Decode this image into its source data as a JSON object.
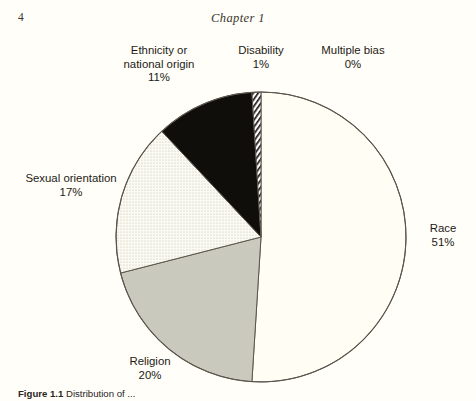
{
  "page": {
    "number": "4",
    "running_head": "Chapter 1"
  },
  "figure": {
    "caption_label": "Figure 1.1",
    "caption_text": "Distribution of ...",
    "center_x": 261,
    "center_y": 237,
    "radius": 145
  },
  "chart_data": {
    "type": "pie",
    "title": "",
    "categories": [
      "Race",
      "Religion",
      "Sexual orientation",
      "Ethnicity or national origin",
      "Disability",
      "Multiple bias"
    ],
    "values": [
      51,
      20,
      17,
      11,
      1,
      0
    ],
    "value_suffix": "%",
    "labels": [
      {
        "name": "Race",
        "pct": "51%",
        "fill": "#fffdf4",
        "pattern": "solid-white"
      },
      {
        "name": "Religion",
        "pct": "20%",
        "fill": "#c9c9bd",
        "pattern": "solid-gray"
      },
      {
        "name": "Sexual orientation",
        "pct": "17%",
        "fill": "#eeeee4",
        "pattern": "dotted"
      },
      {
        "name": "Ethnicity or national origin",
        "pct": "11%",
        "fill": "#100e0b",
        "pattern": "solid-black"
      },
      {
        "name": "Disability",
        "pct": "1%",
        "fill": "#ffffff",
        "pattern": "diagonal-hatch"
      },
      {
        "name": "Multiple bias",
        "pct": "0%",
        "fill": "#ffffff",
        "pattern": "none"
      }
    ],
    "legend_position": "outside-labels",
    "grid": false,
    "start_angle_deg": -90,
    "direction": "clockwise"
  },
  "slice_labels": {
    "ethnicity": {
      "line1": "Ethnicity or",
      "line2": "national origin",
      "pct": "11%"
    },
    "disability": {
      "line1": "Disability",
      "pct": "1%"
    },
    "multiple": {
      "line1": "Multiple bias",
      "pct": "0%"
    },
    "sexual": {
      "line1": "Sexual orientation",
      "pct": "17%"
    },
    "race": {
      "line1": "Race",
      "pct": "51%"
    },
    "religion": {
      "line1": "Religion",
      "pct": "20%"
    }
  },
  "colors": {
    "paper": "#fffef8",
    "ink": "#1d1a16",
    "outline": "#4d4a42",
    "religion_gray": "#c9c9bd",
    "ethnicity_black": "#100e0b",
    "sexual_stipple": "#eeeee4"
  }
}
